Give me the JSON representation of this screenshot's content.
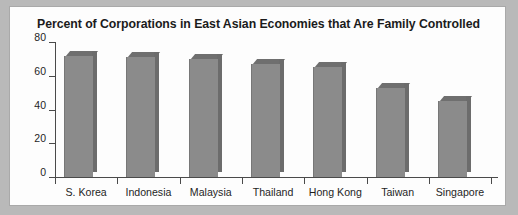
{
  "chart_data": {
    "type": "bar",
    "title": "Percent of Corporations in East Asian Economies that Are Family Controlled",
    "xlabel": "",
    "ylabel": "",
    "categories": [
      "S. Korea",
      "Indonesia",
      "Malaysia",
      "Thailand",
      "Hong Kong",
      "Taiwan",
      "Singapore"
    ],
    "values": [
      72,
      71,
      70,
      67,
      65,
      53,
      45
    ],
    "ylim": [
      0,
      80
    ],
    "yticks": [
      0,
      20,
      40,
      60,
      80
    ],
    "ytick_labels": [
      "0",
      "20",
      "40",
      "60",
      "80"
    ],
    "grid": false,
    "legend": null,
    "style": "3d-bars"
  },
  "colors": {
    "page_background": "#b9b9b9",
    "panel_background": "#fdfdfd",
    "panel_border": "#a9a9a9",
    "bar_front": "#8b8b8b",
    "bar_top": "#6f6f6f",
    "bar_side": "#6c6c6c",
    "axis": "#4a4a4a",
    "text": "#1f1f1f",
    "title_text": "#1b1b1b"
  }
}
